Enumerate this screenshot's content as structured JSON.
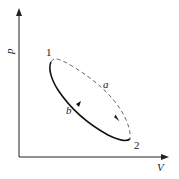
{
  "diagram": {
    "type": "p-V diagram",
    "axes": {
      "y_label": "p",
      "x_label": "V"
    },
    "points": [
      {
        "label": "1"
      },
      {
        "label": "2"
      }
    ],
    "paths": [
      {
        "label": "a",
        "style": "dashed",
        "direction": "1 to 2"
      },
      {
        "label": "b",
        "style": "solid",
        "direction": "2 to 1"
      }
    ]
  }
}
